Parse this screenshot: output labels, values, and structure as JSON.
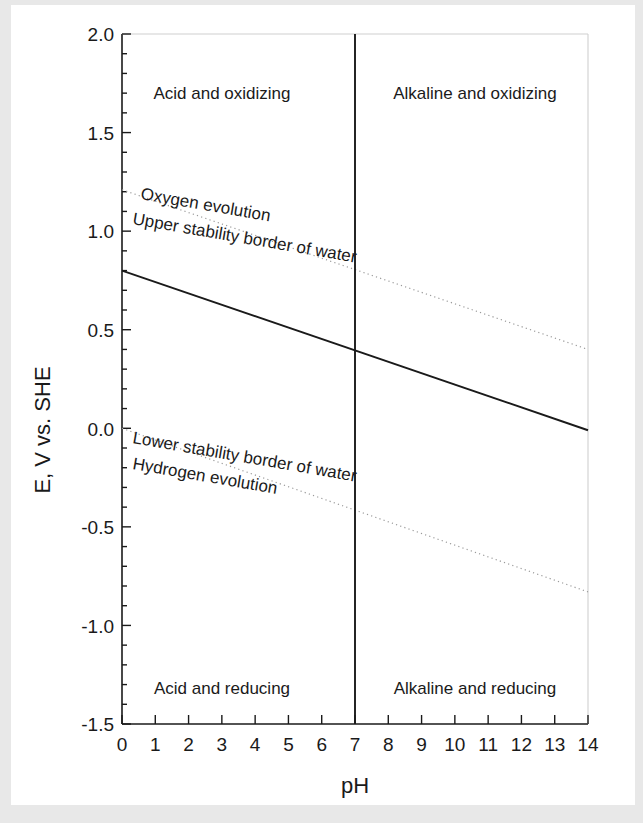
{
  "figure": {
    "background": "#ffffff",
    "paper_edge_color": "#e8e8e8",
    "ink_color": "#1a1a1a",
    "dotted_color": "#9a9a9a"
  },
  "chart_data": {
    "type": "line",
    "title": "",
    "xlabel": "pH",
    "ylabel": "E, V vs. SHE",
    "xlim": [
      0,
      14
    ],
    "ylim": [
      -1.5,
      2.0
    ],
    "xticks": [
      0,
      1,
      2,
      3,
      4,
      5,
      6,
      7,
      8,
      9,
      10,
      11,
      12,
      13,
      14
    ],
    "xtick_labels": [
      "0",
      "1",
      "2",
      "3",
      "4",
      "5",
      "6",
      "7",
      "8",
      "9",
      "10",
      "11",
      "12",
      "13",
      "14"
    ],
    "yticks": [
      -1.5,
      -1.0,
      -0.5,
      0.0,
      0.5,
      1.0,
      1.5,
      2.0
    ],
    "ytick_labels": [
      "-1.5",
      "-1.0",
      "-0.5",
      "0.0",
      "0.5",
      "1.0",
      "1.5",
      "2.0"
    ],
    "yminor_step": 0.1,
    "grid": false,
    "legend": "none",
    "series": [
      {
        "name": "Oxygen evolution / Upper stability border of water",
        "style": "dotted",
        "x": [
          0,
          14
        ],
        "y": [
          1.21,
          0.4
        ]
      },
      {
        "name": "Main potential line",
        "style": "solid",
        "x": [
          0,
          14
        ],
        "y": [
          0.8,
          -0.01
        ]
      },
      {
        "name": "Hydrogen evolution / Lower stability border of water",
        "style": "dotted",
        "x": [
          0,
          14
        ],
        "y": [
          0.0,
          -0.83
        ]
      },
      {
        "name": "Neutral pH divider",
        "style": "solid-vertical",
        "x": [
          7,
          7
        ],
        "y": [
          -1.5,
          2.0
        ]
      }
    ],
    "annotations": [
      {
        "text": "Acid and oxidizing",
        "x": 3.0,
        "y": 1.74,
        "rotation": 0
      },
      {
        "text": "Alkaline and oxidizing",
        "x": 10.6,
        "y": 1.74,
        "rotation": 0
      },
      {
        "text": "Acid and reducing",
        "x": 3.0,
        "y": -1.26,
        "rotation": 0
      },
      {
        "text": "Alkaline and reducing",
        "x": 10.6,
        "y": -1.26,
        "rotation": 0
      },
      {
        "text": "Oxygen evolution",
        "x": 0.6,
        "y": 1.27,
        "rotation": 9.8
      },
      {
        "text": "Upper stability border of water",
        "x": 0.4,
        "y": 1.13,
        "rotation": 9.8
      },
      {
        "text": "Lower stability border of water",
        "x": 0.4,
        "y": 0.04,
        "rotation": 9.8
      },
      {
        "text": "Hydrogen evolution",
        "x": 0.4,
        "y": -0.1,
        "rotation": 9.8
      }
    ]
  },
  "labels": {
    "y_axis_title": "E, V vs. SHE",
    "x_axis_title": "pH",
    "quadrant_top_left": "Acid and oxidizing",
    "quadrant_top_right": "Alkaline and oxidizing",
    "quadrant_bottom_left": "Acid and reducing",
    "quadrant_bottom_right": "Alkaline and reducing",
    "upper_line_label_1": "Oxygen evolution",
    "upper_line_label_2": "Upper stability border of water",
    "lower_line_label_1": "Lower stability border of water",
    "lower_line_label_2": "Hydrogen evolution",
    "ytick_0": "2.0",
    "ytick_1": "1.5",
    "ytick_2": "1.0",
    "ytick_3": "0.5",
    "ytick_4": "0.0",
    "ytick_5": "-0.5",
    "ytick_6": "-1.0",
    "ytick_7": "-1.5"
  }
}
